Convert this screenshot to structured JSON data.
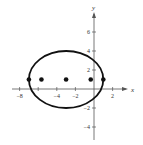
{
  "chart_data": {
    "type": "scatter",
    "title": "",
    "xlabel": "x",
    "ylabel": "y",
    "xlim": [
      -9,
      3
    ],
    "ylim": [
      -5,
      7.5
    ],
    "grid": false,
    "x_ticks": [
      -8,
      -6,
      -4,
      -2,
      2
    ],
    "x_tick_labels": [
      "-8",
      "-4",
      "-2",
      "2"
    ],
    "y_ticks": [
      -4,
      -2,
      2,
      4,
      6
    ],
    "y_tick_labels": [
      "-4",
      "-2",
      "2",
      "4",
      "6"
    ],
    "ellipse": {
      "center": [
        -3,
        1
      ],
      "semi_major_horizontal": 4,
      "semi_minor_vertical": 3,
      "color": "#111111"
    },
    "points": [
      {
        "x": -7,
        "y": 1,
        "label": "vertex"
      },
      {
        "x": -5.65,
        "y": 1,
        "label": "focus"
      },
      {
        "x": -3,
        "y": 1,
        "label": "center"
      },
      {
        "x": -0.35,
        "y": 1,
        "label": "focus"
      },
      {
        "x": 1,
        "y": 1,
        "label": "vertex"
      }
    ]
  }
}
